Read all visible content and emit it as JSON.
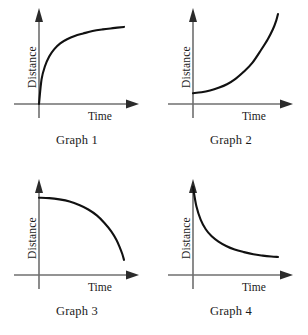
{
  "figure": {
    "background": "#ffffff",
    "curve_color": "#111111",
    "axis_color": "#6f6f6f",
    "arrow_color": "#2b2b2b"
  },
  "chart_data": [
    {
      "type": "line",
      "title": "Graph 1",
      "xlabel": "Time",
      "ylabel": "Distance",
      "shape": "logarithmic-increasing-concave-down",
      "description": "Starts at origin, rises steeply then flattens toward a horizontal asymptote",
      "grid": false,
      "legend": "none",
      "xlim": [
        0,
        1
      ],
      "ylim": [
        0,
        1
      ],
      "x": [
        0.0,
        0.03,
        0.07,
        0.12,
        0.18,
        0.25,
        0.33,
        0.42,
        0.52,
        0.63,
        0.75,
        0.87,
        1.0
      ],
      "y": [
        0.0,
        0.3,
        0.46,
        0.58,
        0.67,
        0.74,
        0.79,
        0.83,
        0.86,
        0.89,
        0.91,
        0.925,
        0.94
      ]
    },
    {
      "type": "line",
      "title": "Graph 2",
      "xlabel": "Time",
      "ylabel": "Distance",
      "shape": "exponential-increasing-concave-up",
      "description": "Starts low on the vertical axis nearly flat, then rises steeply upward",
      "grid": false,
      "legend": "none",
      "xlim": [
        0,
        1
      ],
      "ylim": [
        0,
        1
      ],
      "x": [
        0.0,
        0.1,
        0.2,
        0.3,
        0.4,
        0.5,
        0.6,
        0.7,
        0.8,
        0.88,
        0.94,
        0.98,
        1.0
      ],
      "y": [
        0.12,
        0.13,
        0.15,
        0.18,
        0.22,
        0.28,
        0.36,
        0.46,
        0.6,
        0.72,
        0.83,
        0.93,
        1.0
      ]
    },
    {
      "type": "line",
      "title": "Graph 3",
      "xlabel": "Time",
      "ylabel": "Distance",
      "shape": "decreasing-concave-down",
      "description": "Starts high on the vertical axis nearly flat, then falls away steeply like a quarter circle",
      "grid": false,
      "legend": "none",
      "xlim": [
        0,
        1
      ],
      "ylim": [
        0,
        1
      ],
      "x": [
        0.0,
        0.12,
        0.24,
        0.36,
        0.48,
        0.58,
        0.68,
        0.77,
        0.85,
        0.91,
        0.95,
        0.98,
        1.0
      ],
      "y": [
        0.92,
        0.915,
        0.9,
        0.875,
        0.83,
        0.78,
        0.71,
        0.62,
        0.52,
        0.42,
        0.33,
        0.25,
        0.18
      ]
    },
    {
      "type": "line",
      "title": "Graph 4",
      "xlabel": "Time",
      "ylabel": "Distance",
      "shape": "exponential-decay-concave-up",
      "description": "Starts very high on the vertical axis, drops steeply then levels off toward a horizontal asymptote",
      "grid": false,
      "legend": "none",
      "xlim": [
        0,
        1
      ],
      "ylim": [
        0,
        1
      ],
      "x": [
        0.0,
        0.04,
        0.09,
        0.15,
        0.22,
        0.3,
        0.39,
        0.49,
        0.6,
        0.71,
        0.82,
        0.92,
        1.0
      ],
      "y": [
        1.0,
        0.78,
        0.63,
        0.52,
        0.44,
        0.38,
        0.33,
        0.29,
        0.26,
        0.235,
        0.22,
        0.21,
        0.205
      ]
    }
  ]
}
